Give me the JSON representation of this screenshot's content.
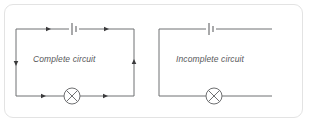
{
  "figure": {
    "background_color": "#ffffff",
    "card_border_color": "#e3e3e3",
    "wire_color": "#6f7072",
    "label_color": "#58585a"
  },
  "circuits": [
    {
      "id": "complete-circuit",
      "label": "Complete circuit",
      "closed": true,
      "components": [
        {
          "type": "battery",
          "name": "battery-symbol",
          "position": "top-wire-center"
        },
        {
          "type": "lamp",
          "name": "lamp-symbol",
          "position": "bottom-wire-center"
        }
      ],
      "current_arrows": [
        {
          "name": "arrow-top-left",
          "direction": "left"
        },
        {
          "name": "arrow-top-right",
          "direction": "left"
        },
        {
          "name": "arrow-left-wire",
          "direction": "down"
        },
        {
          "name": "arrow-right-wire",
          "direction": "up"
        },
        {
          "name": "arrow-bottom-left",
          "direction": "right"
        },
        {
          "name": "arrow-bottom-right",
          "direction": "right"
        }
      ]
    },
    {
      "id": "incomplete-circuit",
      "label": "Incomplete circuit",
      "closed": false,
      "components": [
        {
          "type": "battery",
          "name": "battery-symbol",
          "position": "top-wire-center"
        },
        {
          "type": "lamp",
          "name": "lamp-symbol",
          "position": "bottom-wire-center"
        }
      ],
      "current_arrows": [],
      "gap": "right side vertical wire missing"
    }
  ]
}
